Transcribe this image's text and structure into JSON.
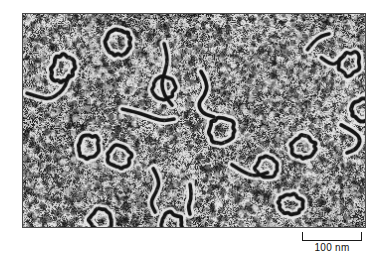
{
  "figure": {
    "type": "electron-micrograph",
    "caption_text": "",
    "panel": {
      "x": 22,
      "y": 13,
      "width": 344,
      "height": 215,
      "border_color": "#4a4a4a",
      "background_color": "#c9c9c9",
      "grain_dark_color": "#1b1b1b",
      "grain_light_color": "#e8e8e8",
      "specimen_color": "#141414"
    }
  },
  "scale_bar": {
    "label": "100 nm",
    "value": 100,
    "unit": "nm",
    "bar_length_px": 60,
    "tick_height_px": 9,
    "color": "#1a1a1a"
  },
  "specimens": {
    "description": "DNA molecules: small closed circles (plasmid loops) and open linear/curved strands on a grainy stained support film",
    "circle_count": 13,
    "strand_count": 10,
    "circles": [
      {
        "cx": 96,
        "cy": 29,
        "rx": 13,
        "ry": 12,
        "rot": -20,
        "w": 4.0
      },
      {
        "cx": 40,
        "cy": 55,
        "rx": 11,
        "ry": 14,
        "rot": 15,
        "w": 4.0
      },
      {
        "cx": 142,
        "cy": 74,
        "rx": 11,
        "ry": 11,
        "rot": 5,
        "w": 3.6
      },
      {
        "cx": 199,
        "cy": 117,
        "rx": 13,
        "ry": 12,
        "rot": -10,
        "w": 3.8
      },
      {
        "cx": 282,
        "cy": 134,
        "rx": 12,
        "ry": 11,
        "rot": 10,
        "w": 3.8
      },
      {
        "cx": 343,
        "cy": 97,
        "rx": 12,
        "ry": 11,
        "rot": -25,
        "w": 4.0
      },
      {
        "cx": 66,
        "cy": 134,
        "rx": 10,
        "ry": 12,
        "rot": 25,
        "w": 3.8
      },
      {
        "cx": 97,
        "cy": 144,
        "rx": 11,
        "ry": 12,
        "rot": -15,
        "w": 3.8
      },
      {
        "cx": 245,
        "cy": 155,
        "rx": 11,
        "ry": 11,
        "rot": 0,
        "w": 3.6
      },
      {
        "cx": 269,
        "cy": 192,
        "rx": 12,
        "ry": 10,
        "rot": 8,
        "w": 3.8
      },
      {
        "cx": 78,
        "cy": 208,
        "rx": 11,
        "ry": 11,
        "rot": -12,
        "w": 3.8
      },
      {
        "cx": 149,
        "cy": 212,
        "rx": 11,
        "ry": 11,
        "rot": 20,
        "w": 3.8
      },
      {
        "cx": 328,
        "cy": 50,
        "rx": 10,
        "ry": 12,
        "rot": 30,
        "w": 3.6
      }
    ],
    "strands": [
      {
        "points": [
          [
            4,
            80
          ],
          [
            16,
            84
          ],
          [
            27,
            86
          ],
          [
            37,
            80
          ],
          [
            43,
            72
          ],
          [
            46,
            62
          ]
        ],
        "w": 3.6
      },
      {
        "points": [
          [
            100,
            96
          ],
          [
            114,
            99
          ],
          [
            128,
            104
          ],
          [
            140,
            108
          ],
          [
            152,
            106
          ]
        ],
        "w": 3.6
      },
      {
        "points": [
          [
            142,
            30
          ],
          [
            146,
            44
          ],
          [
            143,
            58
          ],
          [
            139,
            70
          ],
          [
            142,
            82
          ],
          [
            150,
            92
          ]
        ],
        "w": 3.6
      },
      {
        "points": [
          [
            179,
            58
          ],
          [
            186,
            70
          ],
          [
            183,
            82
          ],
          [
            176,
            90
          ],
          [
            180,
            100
          ],
          [
            192,
            104
          ]
        ],
        "w": 3.8
      },
      {
        "points": [
          [
            210,
            152
          ],
          [
            222,
            160
          ],
          [
            234,
            164
          ],
          [
            246,
            160
          ]
        ],
        "w": 3.6
      },
      {
        "points": [
          [
            131,
            156
          ],
          [
            138,
            168
          ],
          [
            134,
            180
          ],
          [
            128,
            190
          ],
          [
            133,
            200
          ]
        ],
        "w": 3.6
      },
      {
        "points": [
          [
            168,
            172
          ],
          [
            170,
            184
          ],
          [
            166,
            194
          ],
          [
            168,
            202
          ]
        ],
        "w": 3.6
      },
      {
        "points": [
          [
            300,
            44
          ],
          [
            310,
            52
          ],
          [
            318,
            48
          ],
          [
            324,
            40
          ]
        ],
        "w": 3.6
      },
      {
        "points": [
          [
            320,
            112
          ],
          [
            332,
            118
          ],
          [
            340,
            126
          ],
          [
            336,
            136
          ],
          [
            326,
            140
          ]
        ],
        "w": 3.8
      },
      {
        "points": [
          [
            286,
            36
          ],
          [
            292,
            28
          ],
          [
            300,
            22
          ],
          [
            308,
            20
          ]
        ],
        "w": 3.4
      }
    ]
  }
}
